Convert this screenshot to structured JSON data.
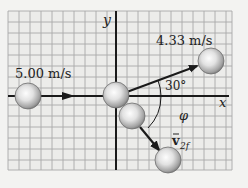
{
  "diagram": {
    "axes": {
      "x_label": "x",
      "y_label": "y"
    },
    "labels": {
      "incoming_speed": "5.00 m/s",
      "outgoing_speed_1": "4.33 m/s",
      "angle_1": "30°",
      "angle_2": "φ",
      "velocity_2_symbol": "v",
      "velocity_2_subscript": "2f"
    },
    "colors": {
      "background": "#f3f3f1",
      "grid_fill": "#ececea",
      "grid_line": "#a9a9a9",
      "axis": "#1a1a1a",
      "ball_light": "#fafafa",
      "ball_dark": "#8a8a8a"
    }
  }
}
